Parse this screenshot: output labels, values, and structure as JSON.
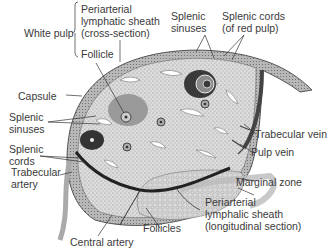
{
  "figure": {
    "labels": {
      "white_pulp": "White pulp",
      "pals_cross": [
        "Periarterial",
        "lymphatic sheath",
        "(cross-section)"
      ],
      "follicle": "Follicle",
      "splenic_sinuses_top": [
        "Splenic",
        "sinuses"
      ],
      "splenic_cords_top": [
        "Splenic cords",
        "(of red pulp)"
      ],
      "capsule": "Capsule",
      "splenic_sinuses_left": [
        "Splenic",
        "sinuses"
      ],
      "splenic_cords_left": [
        "Splenic",
        "cords"
      ],
      "trabecular_artery": [
        "Trabecular",
        "artery"
      ],
      "trabecular_vein": "Trabecular vein",
      "pulp_vein": "Pulp vein",
      "marginal_zone": "Marginal zone",
      "pals_long": [
        "Periarterial",
        "lymphalic sheath",
        "(longitudinal section)"
      ],
      "follicles": "Follicles",
      "central_artery": "Central artery"
    }
  }
}
